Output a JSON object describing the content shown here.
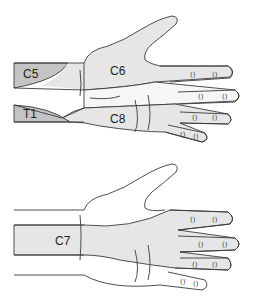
{
  "diagram": {
    "colors": {
      "background": "#ffffff",
      "outline": "#3a3a3a",
      "light_region": "#e6e6e6",
      "dark_region": "#c4c4c4"
    },
    "top_hand": {
      "labels": [
        {
          "id": "c5",
          "text": "C5"
        },
        {
          "id": "c6",
          "text": "C6"
        },
        {
          "id": "t1",
          "text": "T1"
        },
        {
          "id": "c8",
          "text": "C8"
        }
      ]
    },
    "bottom_hand": {
      "labels": [
        {
          "id": "c7",
          "text": "C7"
        }
      ]
    }
  }
}
